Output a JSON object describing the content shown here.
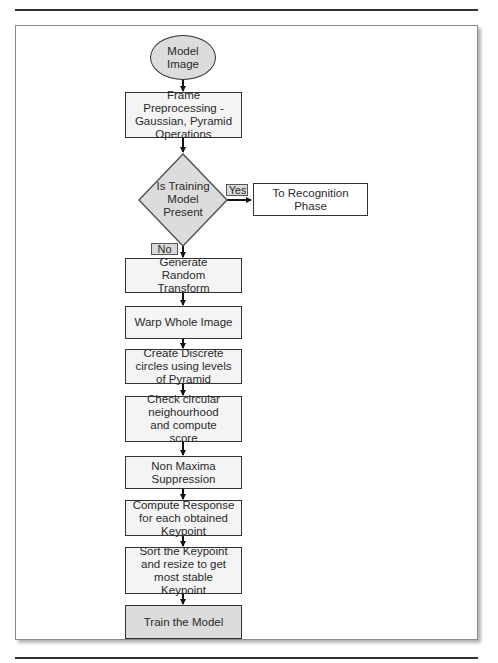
{
  "diagram": {
    "type": "flowchart",
    "start": {
      "label_lines": [
        "Model",
        "Image"
      ]
    },
    "nodes": [
      {
        "id": "preprocess",
        "label": "Frame Preprocessing - Gaussian, Pyramid Operations"
      },
      {
        "id": "decision",
        "label": "Is Training Model Present",
        "shape": "diamond"
      },
      {
        "id": "recognition",
        "label": "To Recognition Phase"
      },
      {
        "id": "random_transform",
        "label": "Generate Random Transform"
      },
      {
        "id": "warp",
        "label": "Warp Whole Image"
      },
      {
        "id": "circles",
        "label": "Create Discrete circles using levels of Pyramid"
      },
      {
        "id": "neighbourhood",
        "label": "Check circular neighourhood and compute score"
      },
      {
        "id": "nms",
        "label": "Non Maxima Suppression"
      },
      {
        "id": "response",
        "label": "Compute Response for each obtained Keypoint"
      },
      {
        "id": "sort",
        "label": "Sort the Keypoint and resize to get most stable Keypoint"
      },
      {
        "id": "train",
        "label": "Train the Model"
      }
    ],
    "decision_lines": [
      "Is Training",
      "Model",
      "Present"
    ],
    "branches": {
      "yes": "Yes",
      "no": "No"
    },
    "colors": {
      "stroke": "#333333",
      "box_fill": "#f4f4f4",
      "highlight_fill": "#dcdcdc",
      "label_fill": "#d9d9d9"
    }
  }
}
